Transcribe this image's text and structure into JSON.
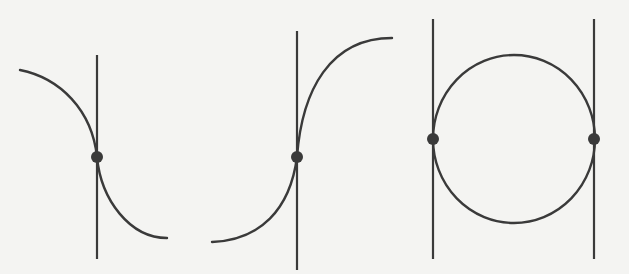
{
  "diagram": {
    "background": "#f4f4f2",
    "stroke_color": "#3a3a3a",
    "panels": [
      {
        "id": "panel-1",
        "description": "decreasing curve with vertical tangent line at inflection point",
        "vertical_lines": [
          {
            "x": 97,
            "y1": 55,
            "y2": 259
          }
        ],
        "curve_path": "M 20 70 C 60 78, 92 110, 97 157 C 101 200, 130 238, 167 238",
        "points": [
          {
            "x": 97,
            "y": 157
          }
        ]
      },
      {
        "id": "panel-2",
        "description": "increasing curve with vertical tangent line at inflection point",
        "vertical_lines": [
          {
            "x": 297,
            "y1": 31,
            "y2": 270
          }
        ],
        "curve_path": "M 212 242 C 260 240, 290 210, 297 157 C 302 90, 330 38, 392 38",
        "points": [
          {
            "x": 297,
            "y": 157
          }
        ]
      },
      {
        "id": "panel-3",
        "description": "circle with two parallel vertical tangent lines",
        "vertical_lines": [
          {
            "x": 433,
            "y1": 19,
            "y2": 259
          },
          {
            "x": 594,
            "y1": 19,
            "y2": 259
          }
        ],
        "circle": {
          "cx": 514,
          "cy": 139,
          "rx": 81,
          "ry": 84
        },
        "points": [
          {
            "x": 433,
            "y": 139
          },
          {
            "x": 594,
            "y": 139
          }
        ]
      }
    ]
  }
}
